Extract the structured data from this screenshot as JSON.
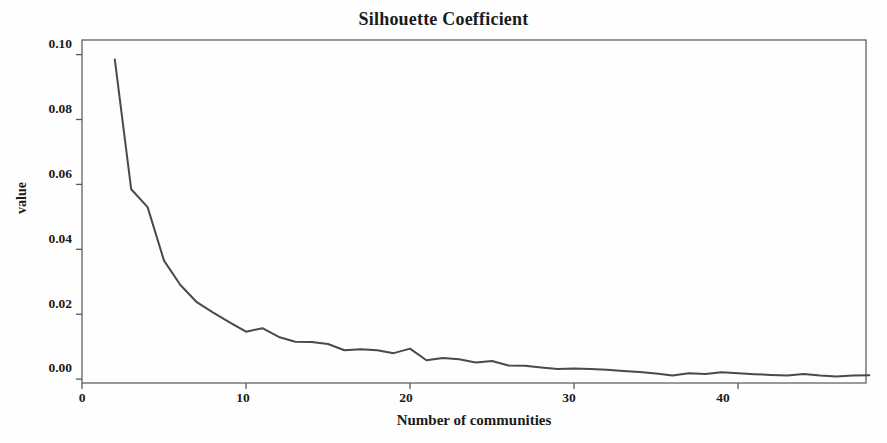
{
  "chart_data": {
    "type": "line",
    "title": "Silhouette Coefficient",
    "xlabel": "Number of communities",
    "ylabel": "value",
    "grid": false,
    "legend": "none",
    "xlim": [
      0,
      47.8
    ],
    "ylim": [
      -0.0012,
      0.1045
    ],
    "xticks": [
      0,
      10,
      20,
      30,
      40
    ],
    "xticklabels": [
      "0",
      "10",
      "20",
      "30",
      "40"
    ],
    "yticks": [
      0.0,
      0.02,
      0.04,
      0.06,
      0.08,
      0.1
    ],
    "yticklabels": [
      "0.00",
      "0.02",
      "0.04",
      "0.06",
      "0.08",
      "0.10"
    ],
    "line_color": "#4a4a4a",
    "frame_color": "#6e6e6e",
    "series": [
      {
        "name": "silhouette coefficient",
        "x": [
          2,
          3,
          4,
          5,
          6,
          7,
          8,
          9,
          10,
          11,
          12,
          13,
          14,
          15,
          16,
          17,
          18,
          19,
          20,
          21,
          22,
          23,
          24,
          25,
          26,
          27,
          28,
          29,
          30,
          31,
          32,
          33,
          34,
          35,
          36,
          37,
          38,
          39,
          40,
          41,
          42,
          43,
          44,
          45,
          46,
          47,
          48
        ],
        "values": [
          0.0985,
          0.0585,
          0.053,
          0.0365,
          0.029,
          0.0237,
          0.0205,
          0.0175,
          0.0146,
          0.0157,
          0.013,
          0.0115,
          0.0114,
          0.0108,
          0.0089,
          0.0092,
          0.0089,
          0.008,
          0.0094,
          0.0058,
          0.0065,
          0.0061,
          0.0051,
          0.0056,
          0.0042,
          0.0041,
          0.0036,
          0.0031,
          0.0033,
          0.0031,
          0.0029,
          0.0025,
          0.0022,
          0.0017,
          0.0011,
          0.0018,
          0.0016,
          0.0021,
          0.0018,
          0.0015,
          0.0013,
          0.0011,
          0.0016,
          0.0011,
          0.0008,
          0.0011,
          0.0012
        ]
      }
    ]
  },
  "figure": {
    "title": "Silhouette Coefficient",
    "xlabel": "Number of communities",
    "ylabel": "value",
    "xticklabels": [
      "0",
      "10",
      "20",
      "30",
      "40"
    ],
    "yticklabels": [
      "0.00",
      "0.02",
      "0.04",
      "0.06",
      "0.08",
      "0.10"
    ]
  }
}
